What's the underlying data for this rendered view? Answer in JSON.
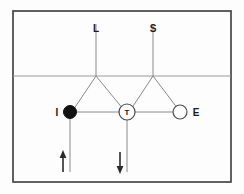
{
  "figure": {
    "background_color": "#fdfdfd",
    "frame": {
      "x": 13,
      "y": 11,
      "width": 218,
      "height": 171,
      "color": "#3a3a3a"
    },
    "surface_line": {
      "y": 76,
      "x1": 13,
      "x2": 231,
      "color": "#9a9a9a"
    },
    "edge_color": "#8a8a8a"
  },
  "nodes": [
    {
      "id": "L",
      "label": "L",
      "type": "terminal-top",
      "x": 96,
      "y": 76,
      "label_x": 96,
      "label_y": 31,
      "stem_top_y": 24
    },
    {
      "id": "S",
      "label": "S",
      "type": "terminal-top",
      "x": 153,
      "y": 76,
      "label_x": 153,
      "label_y": 31,
      "stem_top_y": 24
    },
    {
      "id": "I",
      "label": "I",
      "type": "filled-circle",
      "x": 70,
      "y": 112,
      "radius": 6.5,
      "label_x": 57,
      "label_y": 115,
      "fill": "#111111"
    },
    {
      "id": "T",
      "label": "T",
      "type": "open-circle-labeled",
      "x": 127,
      "y": 112,
      "radius": 8,
      "inner_label": "T",
      "fill": "#ffffff"
    },
    {
      "id": "E",
      "label": "E",
      "type": "open-circle",
      "x": 180,
      "y": 112,
      "radius": 7,
      "label_x": 195,
      "label_y": 115,
      "fill": "#ffffff"
    }
  ],
  "edges": [
    {
      "from": "L-stem-top",
      "to": "L",
      "x1": 96,
      "y1": 24,
      "x2": 96,
      "y2": 76
    },
    {
      "from": "S-stem-top",
      "to": "S",
      "x1": 153,
      "y1": 24,
      "x2": 153,
      "y2": 76
    },
    {
      "from": "L",
      "to": "I",
      "x1": 96,
      "y1": 76,
      "x2": 74,
      "y2": 108
    },
    {
      "from": "L",
      "to": "T",
      "x1": 96,
      "y1": 76,
      "x2": 122,
      "y2": 107
    },
    {
      "from": "S",
      "to": "T",
      "x1": 153,
      "y1": 76,
      "x2": 133,
      "y2": 107
    },
    {
      "from": "S",
      "to": "E",
      "x1": 153,
      "y1": 76,
      "x2": 177,
      "y2": 107
    },
    {
      "from": "I",
      "to": "T",
      "x1": 76,
      "y1": 112,
      "x2": 119,
      "y2": 112
    },
    {
      "from": "T",
      "to": "E",
      "x1": 135,
      "y1": 112,
      "x2": 173,
      "y2": 112
    },
    {
      "from": "I",
      "to": "ground",
      "x1": 70,
      "y1": 118,
      "x2": 70,
      "y2": 172
    },
    {
      "from": "T",
      "to": "ground",
      "x1": 127,
      "y1": 120,
      "x2": 127,
      "y2": 172
    }
  ],
  "arrows": [
    {
      "id": "arrow-left",
      "direction": "up",
      "x": 63,
      "y_tail": 172,
      "y_head": 152,
      "color": "#2a2a2a"
    },
    {
      "id": "arrow-middle",
      "direction": "down",
      "x": 120,
      "y_tail": 152,
      "y_head": 172,
      "color": "#2a2a2a"
    }
  ],
  "labels": {
    "l_label": "L",
    "s_label": "S",
    "i_label": "I",
    "t_label": "T",
    "e_label": "E"
  }
}
